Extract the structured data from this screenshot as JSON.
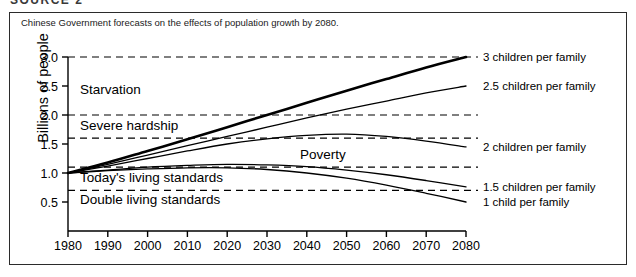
{
  "top_heading": "SOURCE 2",
  "caption": "Chinese Government forecasts on the effects of population growth by 2080.",
  "chart_data": {
    "type": "line",
    "title": "Chinese Government forecasts on the effects of population growth by 2080.",
    "xlabel": "",
    "ylabel": "Billions of people",
    "xlim": [
      1980,
      2080
    ],
    "ylim": [
      0.25,
      3.1
    ],
    "grid": false,
    "legend_position": "right-of-plot",
    "x": [
      1980,
      1990,
      2000,
      2010,
      2020,
      2030,
      2040,
      2050,
      2060,
      2070,
      2080
    ],
    "xticks": [
      "1980",
      "1990",
      "2000",
      "2010",
      "2020",
      "2030",
      "2040",
      "2050",
      "2060",
      "2070",
      "2080"
    ],
    "yticks": [
      "0.5",
      "1.0",
      "1.5",
      "2.0",
      "2.5",
      "3.0"
    ],
    "ytick_values": [
      0.5,
      1.0,
      1.5,
      2.0,
      2.5,
      3.0
    ],
    "series": [
      {
        "name": "3 children per family",
        "label": "3 children per family",
        "emphasis": "thick",
        "values": [
          1.0,
          1.18,
          1.38,
          1.58,
          1.79,
          2.0,
          2.21,
          2.42,
          2.62,
          2.82,
          3.0
        ]
      },
      {
        "name": "2.5 children per family",
        "label": "2.5 children per family",
        "emphasis": "normal",
        "values": [
          1.0,
          1.15,
          1.31,
          1.47,
          1.63,
          1.79,
          1.95,
          2.1,
          2.24,
          2.38,
          2.5
        ]
      },
      {
        "name": "2 children per family",
        "label": "2 children per family",
        "emphasis": "normal",
        "values": [
          1.0,
          1.12,
          1.25,
          1.38,
          1.5,
          1.59,
          1.65,
          1.67,
          1.63,
          1.55,
          1.45
        ]
      },
      {
        "name": "1.5 children per family",
        "label": "1.5 children per family",
        "emphasis": "normal",
        "values": [
          1.0,
          1.05,
          1.1,
          1.13,
          1.15,
          1.14,
          1.11,
          1.05,
          0.97,
          0.87,
          0.76
        ]
      },
      {
        "name": "1 child per family",
        "label": "1 child per family",
        "emphasis": "normal",
        "values": [
          1.0,
          1.04,
          1.07,
          1.09,
          1.09,
          1.06,
          1.0,
          0.91,
          0.79,
          0.65,
          0.5
        ]
      }
    ],
    "threshold_lines": [
      {
        "name": "starvation-upper",
        "value": 3.0
      },
      {
        "name": "severe-hardship-upper",
        "value": 2.0
      },
      {
        "name": "poverty-upper",
        "value": 1.6
      },
      {
        "name": "poverty-lower",
        "value": 1.1
      },
      {
        "name": "double-living-standards-upper",
        "value": 0.7
      }
    ],
    "zone_labels": [
      {
        "name": "starvation",
        "text": "Starvation",
        "value": 2.45
      },
      {
        "name": "severe-hardship",
        "text": "Severe hardship",
        "value": 1.82
      },
      {
        "name": "poverty",
        "text": "Poverty",
        "value": 1.33
      },
      {
        "name": "todays-living-standards",
        "text": "Today's living standards",
        "value": 0.93
      },
      {
        "name": "double-living-standards",
        "text": "Double living standards",
        "value": 0.55
      }
    ]
  }
}
